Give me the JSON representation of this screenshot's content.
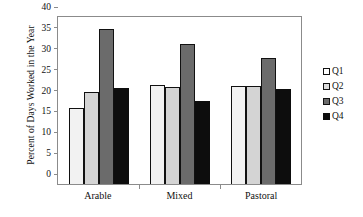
{
  "chart_data": {
    "type": "bar",
    "title": "",
    "xlabel": "",
    "ylabel": "Percent of Days Worked in the Year",
    "categories": [
      "Arable",
      "Mixed",
      "Pastoral"
    ],
    "series": [
      {
        "name": "Q1",
        "color": "#f2f2f2",
        "values": [
          18.1,
          23.7,
          23.4
        ]
      },
      {
        "name": "Q2",
        "color": "#d4d4d4",
        "values": [
          22.0,
          23.2,
          23.4
        ]
      },
      {
        "name": "Q3",
        "color": "#6b6b6b",
        "values": [
          37.2,
          33.6,
          30.3
        ]
      },
      {
        "name": "Q4",
        "color": "#0d0d0d",
        "values": [
          23.0,
          19.9,
          22.8
        ]
      }
    ],
    "ylim": [
      0,
      40
    ],
    "yticks": [
      0,
      5,
      10,
      15,
      20,
      25,
      30,
      35,
      40
    ],
    "ytick_labels": [
      "0",
      "5",
      "10",
      "15",
      "20",
      "25",
      "30",
      "35",
      "40"
    ],
    "grid": false,
    "legend_position": "right",
    "legend_entries": [
      "Q1",
      "Q2",
      "Q3",
      "Q4"
    ]
  }
}
